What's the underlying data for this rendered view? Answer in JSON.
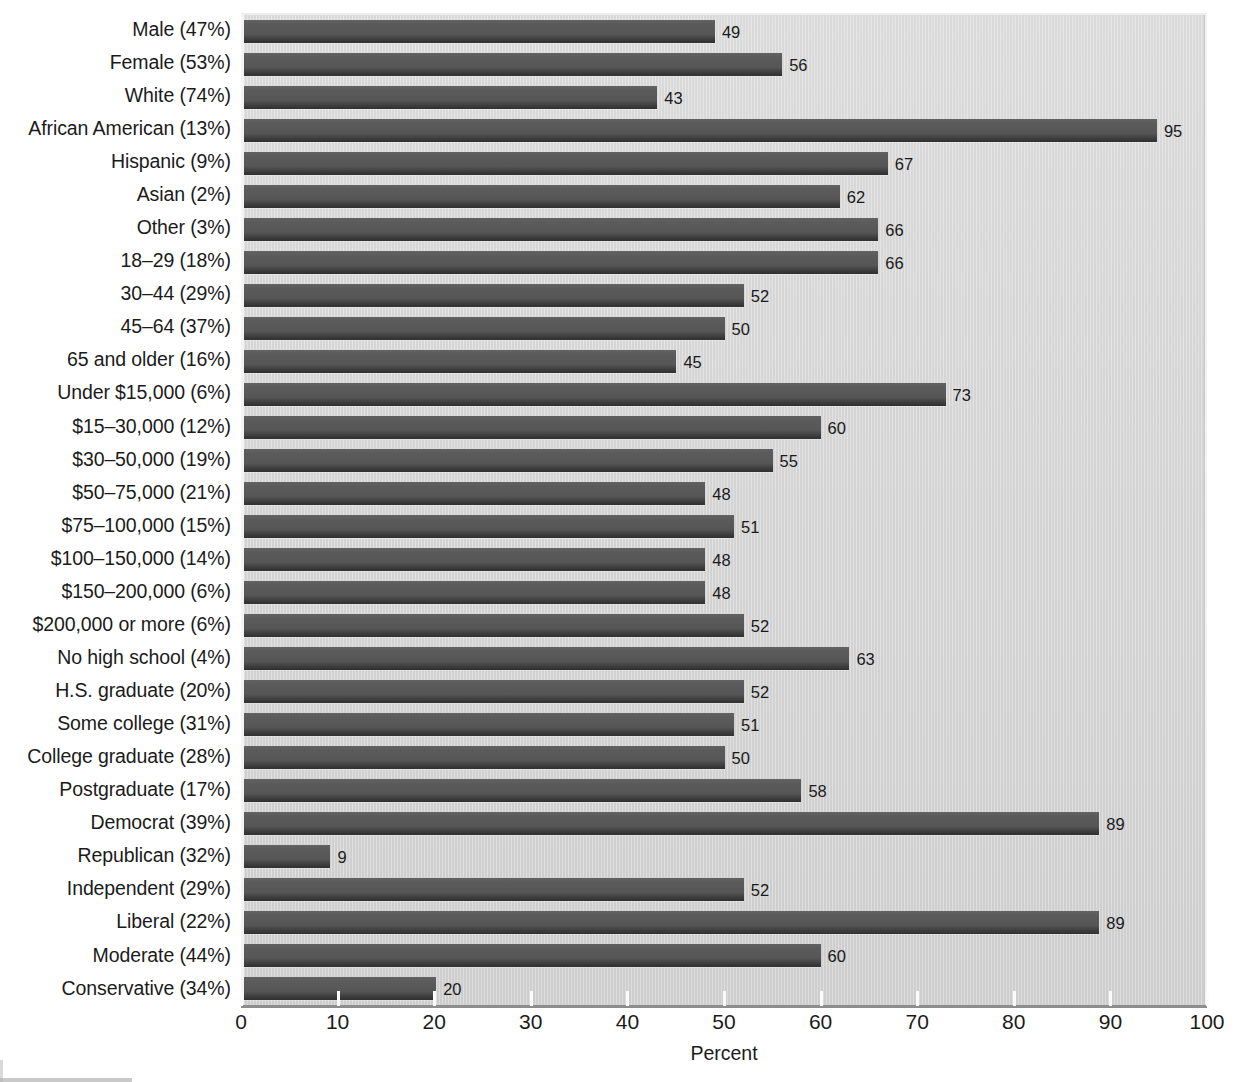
{
  "chart_data": {
    "type": "bar",
    "orientation": "horizontal",
    "title": "",
    "xlabel": "Percent",
    "ylabel": "",
    "xlim": [
      0,
      100
    ],
    "xticks": [
      0,
      10,
      20,
      30,
      40,
      50,
      60,
      70,
      80,
      90,
      100
    ],
    "xtick_labels": [
      "0",
      "10",
      "20",
      "30",
      "40",
      "50",
      "60",
      "70",
      "80",
      "90",
      "100"
    ],
    "grid": false,
    "legend": false,
    "bar_color": "#585858",
    "plot_background": "#d6d6d6",
    "value_labels_shown": true,
    "categories": [
      "Male (47%)",
      "Female (53%)",
      "White (74%)",
      "African American (13%)",
      "Hispanic (9%)",
      "Asian (2%)",
      "Other (3%)",
      "18–29 (18%)",
      "30–44 (29%)",
      "45–64 (37%)",
      "65 and older (16%)",
      "Under $15,000 (6%)",
      "$15–30,000 (12%)",
      "$30–50,000 (19%)",
      "$50–75,000 (21%)",
      "$75–100,000 (15%)",
      "$100–150,000 (14%)",
      "$150–200,000 (6%)",
      "$200,000 or more (6%)",
      "No high school (4%)",
      "H.S. graduate (20%)",
      "Some college (31%)",
      "College graduate (28%)",
      "Postgraduate (17%)",
      "Democrat (39%)",
      "Republican (32%)",
      "Independent (29%)",
      "Liberal (22%)",
      "Moderate (44%)",
      "Conservative (34%)"
    ],
    "values": [
      49,
      56,
      43,
      95,
      67,
      62,
      66,
      66,
      52,
      50,
      45,
      73,
      60,
      55,
      48,
      51,
      48,
      48,
      52,
      63,
      52,
      51,
      50,
      58,
      89,
      9,
      52,
      89,
      60,
      20
    ],
    "value_label_texts": [
      "49",
      "56",
      "43",
      "95",
      "67",
      "62",
      "66",
      "66",
      "52",
      "50",
      "45",
      "73",
      "60",
      "55",
      "48",
      "51",
      "48",
      "48",
      "52",
      "63",
      "52",
      "51",
      "50",
      "58",
      "89",
      "9",
      "52",
      "89",
      "60",
      "20"
    ]
  }
}
